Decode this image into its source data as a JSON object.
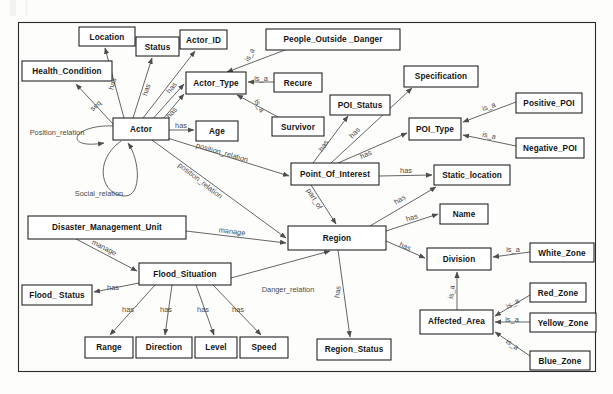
{
  "diagram": {
    "type": "ontology-er-diagram",
    "title": "",
    "frame": {
      "x": 18,
      "y": 22,
      "width": 578,
      "height": 350
    },
    "colors": {
      "node_fill": "#ffffff",
      "node_stroke": "#1b1b1b",
      "edge_stroke": "#5d5d5d",
      "edge_label": "#4a4a4a",
      "background": "#fdfdfc"
    },
    "nodes": [
      {
        "id": "location",
        "label": "Location",
        "x": 79,
        "y": 27,
        "w": 56,
        "h": 19
      },
      {
        "id": "status",
        "label": "Status",
        "x": 136,
        "y": 37,
        "w": 43,
        "h": 19
      },
      {
        "id": "actor_id",
        "label": "Actor_ID",
        "x": 180,
        "y": 30,
        "w": 47,
        "h": 19
      },
      {
        "id": "people_outside",
        "label": "People_Outside _Danger",
        "x": 266,
        "y": 29,
        "w": 134,
        "h": 21
      },
      {
        "id": "health_condition",
        "label": "Health_Condition",
        "x": 22,
        "y": 61,
        "w": 90,
        "h": 20
      },
      {
        "id": "actor_type",
        "label": "Actor_Type",
        "x": 186,
        "y": 72,
        "w": 60,
        "h": 22
      },
      {
        "id": "recure",
        "label": "Recure",
        "x": 274,
        "y": 73,
        "w": 48,
        "h": 19
      },
      {
        "id": "specification",
        "label": "Specification",
        "x": 404,
        "y": 66,
        "w": 74,
        "h": 21
      },
      {
        "id": "poi_status",
        "label": "POI_Status",
        "x": 330,
        "y": 95,
        "w": 60,
        "h": 20
      },
      {
        "id": "positive_poi",
        "label": "Positive_POI",
        "x": 516,
        "y": 93,
        "w": 66,
        "h": 20
      },
      {
        "id": "actor",
        "label": "Actor",
        "x": 113,
        "y": 118,
        "w": 56,
        "h": 22
      },
      {
        "id": "age",
        "label": "Age",
        "x": 196,
        "y": 121,
        "w": 42,
        "h": 20
      },
      {
        "id": "survivor",
        "label": "Survivor",
        "x": 272,
        "y": 117,
        "w": 52,
        "h": 19
      },
      {
        "id": "poi_type",
        "label": "POI_Type",
        "x": 409,
        "y": 118,
        "w": 52,
        "h": 22
      },
      {
        "id": "negative_poi",
        "label": "Negative_POI",
        "x": 516,
        "y": 138,
        "w": 68,
        "h": 20
      },
      {
        "id": "point_of_interest",
        "label": "Point_Of_Interest",
        "x": 291,
        "y": 163,
        "w": 88,
        "h": 22
      },
      {
        "id": "static_location",
        "label": "Static_location",
        "x": 434,
        "y": 165,
        "w": 76,
        "h": 20
      },
      {
        "id": "disaster_unit",
        "label": "Disaster_Management_Unit",
        "x": 28,
        "y": 216,
        "w": 158,
        "h": 23
      },
      {
        "id": "name",
        "label": "Name",
        "x": 440,
        "y": 204,
        "w": 48,
        "h": 20
      },
      {
        "id": "region",
        "label": "Region",
        "x": 288,
        "y": 226,
        "w": 98,
        "h": 24
      },
      {
        "id": "division",
        "label": "Division",
        "x": 427,
        "y": 248,
        "w": 64,
        "h": 22
      },
      {
        "id": "white_zone",
        "label": "White_Zone",
        "x": 530,
        "y": 243,
        "w": 64,
        "h": 19
      },
      {
        "id": "flood_situation",
        "label": "Flood_Situation",
        "x": 139,
        "y": 263,
        "w": 92,
        "h": 22
      },
      {
        "id": "flood_status",
        "label": "Flood_ Status",
        "x": 22,
        "y": 285,
        "w": 70,
        "h": 20
      },
      {
        "id": "red_zone",
        "label": "Red_Zone",
        "x": 530,
        "y": 283,
        "w": 56,
        "h": 19
      },
      {
        "id": "yellow_zone",
        "label": "Yellow_Zone",
        "x": 530,
        "y": 313,
        "w": 66,
        "h": 19
      },
      {
        "id": "affected_area",
        "label": "Affected_Area",
        "x": 420,
        "y": 310,
        "w": 73,
        "h": 24
      },
      {
        "id": "region_status",
        "label": "Region_Status",
        "x": 317,
        "y": 339,
        "w": 74,
        "h": 21
      },
      {
        "id": "blue_zone",
        "label": "Blue_Zone",
        "x": 530,
        "y": 351,
        "w": 60,
        "h": 19
      },
      {
        "id": "range",
        "label": "Range",
        "x": 85,
        "y": 337,
        "w": 48,
        "h": 21
      },
      {
        "id": "direction",
        "label": "Direction",
        "x": 136,
        "y": 337,
        "w": 56,
        "h": 21
      },
      {
        "id": "level",
        "label": "Level",
        "x": 195,
        "y": 337,
        "w": 42,
        "h": 21
      },
      {
        "id": "speed",
        "label": "Speed",
        "x": 240,
        "y": 337,
        "w": 48,
        "h": 21
      }
    ],
    "edges": [
      {
        "from": "actor",
        "to": "location",
        "label": "has"
      },
      {
        "from": "actor",
        "to": "status",
        "label": "has"
      },
      {
        "from": "actor",
        "to": "actor_id",
        "label": "has"
      },
      {
        "from": "actor",
        "to": "actor_type",
        "label": "has"
      },
      {
        "from": "actor",
        "to": "health_condition",
        "label": "seq"
      },
      {
        "from": "actor",
        "to": "age",
        "label": "has"
      },
      {
        "from": "actor",
        "to": "actor",
        "label": "Position_relation"
      },
      {
        "from": "actor",
        "to": "actor",
        "label": "Social_relation"
      },
      {
        "from": "actor",
        "to": "point_of_interest",
        "label": "position_relation"
      },
      {
        "from": "actor",
        "to": "region",
        "label": "position_relation"
      },
      {
        "from": "people_outside",
        "to": "actor_type",
        "label": "is_a"
      },
      {
        "from": "recure",
        "to": "actor_type",
        "label": "is_a"
      },
      {
        "from": "survivor",
        "to": "actor_type",
        "label": "is_a"
      },
      {
        "from": "point_of_interest",
        "to": "poi_status",
        "label": "has"
      },
      {
        "from": "point_of_interest",
        "to": "specification",
        "label": "has"
      },
      {
        "from": "point_of_interest",
        "to": "poi_type",
        "label": "has"
      },
      {
        "from": "point_of_interest",
        "to": "static_location",
        "label": "has"
      },
      {
        "from": "point_of_interest",
        "to": "region",
        "label": "part_of"
      },
      {
        "from": "positive_poi",
        "to": "poi_type",
        "label": "is_a"
      },
      {
        "from": "negative_poi",
        "to": "poi_type",
        "label": "is_a"
      },
      {
        "from": "region",
        "to": "static_location",
        "label": "has"
      },
      {
        "from": "region",
        "to": "name",
        "label": "has"
      },
      {
        "from": "region",
        "to": "division",
        "label": "has"
      },
      {
        "from": "region",
        "to": "region_status",
        "label": "has"
      },
      {
        "from": "white_zone",
        "to": "division",
        "label": "is_a"
      },
      {
        "from": "affected_area",
        "to": "division",
        "label": "is_a"
      },
      {
        "from": "red_zone",
        "to": "affected_area",
        "label": "is_a"
      },
      {
        "from": "yellow_zone",
        "to": "affected_area",
        "label": "is_a"
      },
      {
        "from": "blue_zone",
        "to": "affected_area",
        "label": "is_a"
      },
      {
        "from": "disaster_unit",
        "to": "region",
        "label": "manage"
      },
      {
        "from": "disaster_unit",
        "to": "flood_situation",
        "label": "manage"
      },
      {
        "from": "flood_situation",
        "to": "flood_status",
        "label": "has"
      },
      {
        "from": "flood_situation",
        "to": "range",
        "label": "has"
      },
      {
        "from": "flood_situation",
        "to": "direction",
        "label": "has"
      },
      {
        "from": "flood_situation",
        "to": "level",
        "label": "has"
      },
      {
        "from": "flood_situation",
        "to": "speed",
        "label": "has"
      },
      {
        "from": "flood_situation",
        "to": "region",
        "label": "Danger_relation"
      }
    ]
  }
}
